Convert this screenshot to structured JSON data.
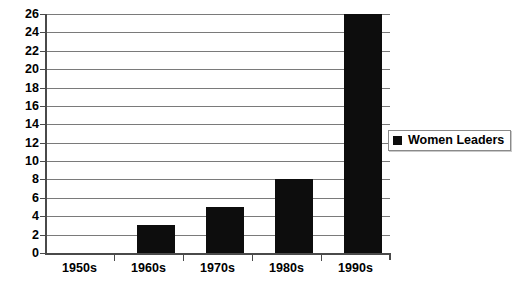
{
  "chart_data": {
    "type": "bar",
    "title": "",
    "xlabel": "",
    "ylabel": "",
    "categories": [
      "1950s",
      "1960s",
      "1970s",
      "1980s",
      "1990s"
    ],
    "values": [
      0,
      3,
      5,
      8,
      26
    ],
    "series": [
      {
        "name": "Women Leaders",
        "values": [
          0,
          3,
          5,
          8,
          26
        ]
      }
    ],
    "ylim": [
      0,
      26
    ],
    "ytick_step": 2,
    "yticks": [
      0,
      2,
      4,
      6,
      8,
      10,
      12,
      14,
      16,
      18,
      20,
      22,
      24,
      26
    ],
    "grid": true,
    "legend_position": "right",
    "legend": [
      {
        "label": "Women Leaders",
        "color": "#0d0d0d"
      }
    ],
    "colors": {
      "bar": "#0d0d0d",
      "gridline": "#7a7a7a",
      "axis": "#4a4a4a",
      "background": "#ffffff",
      "text": "#000000"
    }
  }
}
